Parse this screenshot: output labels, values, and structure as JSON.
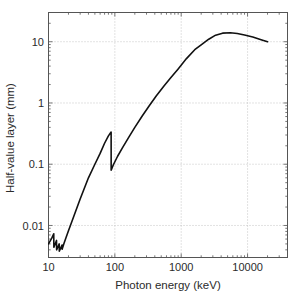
{
  "chart_data": {
    "type": "line",
    "title": "",
    "xlabel": "Photon energy (keV)",
    "ylabel": "Half-value layer (mm)",
    "xscale": "log",
    "yscale": "log",
    "xlim": [
      10,
      40000
    ],
    "ylim": [
      0.003,
      30
    ],
    "grid": true,
    "legend": false,
    "xticks": [
      10,
      100,
      1000,
      10000
    ],
    "xticklabels": [
      "10",
      "100",
      "1000",
      "10000"
    ],
    "yticks": [
      0.01,
      0.1,
      1,
      10
    ],
    "yticklabels": [
      "0.01",
      "0.1",
      "1",
      "10"
    ],
    "series": [
      {
        "name": "Half-value layer",
        "color": "#111111",
        "linewidth": 1.6,
        "x": [
          10.0,
          11.2,
          12.0,
          12.05,
          12.6,
          13.2,
          13.25,
          13.9,
          14.5,
          14.55,
          15.3,
          16.0,
          16.05,
          17.0,
          18.5,
          20.0,
          24.0,
          30.0,
          40.0,
          50.0,
          60.0,
          70.0,
          80.0,
          87.9,
          88.0,
          95.0,
          110.0,
          130.0,
          160.0,
          200.0,
          260.0,
          330.0,
          420.0,
          550.0,
          700.0,
          900.0,
          1200.0,
          1600.0,
          2000.0,
          2600.0,
          3300.0,
          4200.0,
          5500.0,
          7000.0,
          9000.0,
          12000.0,
          16000.0,
          20000.0
        ],
        "y": [
          0.005,
          0.0062,
          0.0073,
          0.0044,
          0.005,
          0.0057,
          0.004,
          0.0045,
          0.005,
          0.0038,
          0.0043,
          0.0048,
          0.0041,
          0.005,
          0.0065,
          0.0082,
          0.014,
          0.027,
          0.06,
          0.1,
          0.15,
          0.22,
          0.29,
          0.335,
          0.08,
          0.098,
          0.135,
          0.185,
          0.27,
          0.4,
          0.62,
          0.9,
          1.3,
          1.9,
          2.6,
          3.6,
          5.3,
          7.4,
          8.9,
          11.0,
          12.8,
          13.8,
          14.0,
          13.6,
          12.9,
          11.9,
          10.8,
          10.0
        ]
      }
    ],
    "annotations": [
      {
        "name": "k-edge-discontinuity",
        "x": 88,
        "note": "K-edge jump"
      },
      {
        "name": "l-edge-structure",
        "x_range": [
          12,
          16
        ],
        "note": "L-edge sawtooth"
      }
    ]
  },
  "axes": {
    "xlabel": "Photon energy (keV)",
    "ylabel": "Half-value layer (mm)",
    "xticklabels": [
      "10",
      "100",
      "1000",
      "10000"
    ],
    "yticklabels": [
      "10",
      "1",
      "0.1",
      "0.01"
    ]
  },
  "style": {
    "frame_color": "#555555",
    "grid_color": "#b8b8b8",
    "line_color": "#111111",
    "text_color": "#2b2b2b",
    "background": "#ffffff"
  }
}
